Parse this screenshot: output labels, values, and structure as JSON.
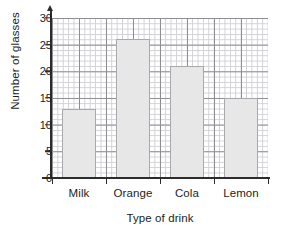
{
  "chart_data": {
    "type": "bar",
    "title": "",
    "categories": [
      "Milk",
      "Orange",
      "Cola",
      "Lemon"
    ],
    "values": [
      13,
      26,
      21,
      15
    ],
    "xlabel": "Type of drink",
    "ylabel": "Number of glasses",
    "ylim": [
      0,
      30
    ],
    "ytick_labels": [
      "0",
      "5",
      "10",
      "15",
      "20",
      "25",
      "30"
    ],
    "ytick_values": [
      0,
      5,
      10,
      15,
      20,
      25,
      30
    ],
    "grid": "graph-paper-minor-and-major",
    "legend": "none",
    "bar_fill_color": "#e7e7e7",
    "bar_edge_color": "#a8a8ad",
    "axis_color": "#2c2c2c",
    "grid_major_color": "#8d8d92",
    "grid_minor_color": "#cfcfd4"
  }
}
